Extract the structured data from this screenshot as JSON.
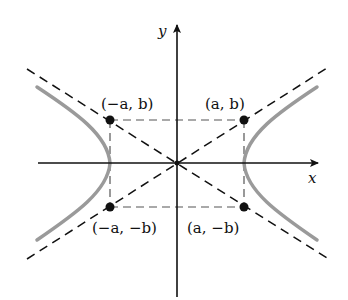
{
  "diagram": {
    "type": "hyperbola",
    "axes": {
      "x_label": "x",
      "y_label": "y"
    },
    "points": [
      {
        "id": "neg-a-b",
        "label": "(−a, b)"
      },
      {
        "id": "a-b",
        "label": "(a, b)"
      },
      {
        "id": "neg-a-neg-b",
        "label": "(−a, −b)"
      },
      {
        "id": "a-neg-b",
        "label": "(a, −b)"
      }
    ],
    "colors": {
      "axis": "#111111",
      "curve": "#9a9a9a",
      "asymptote": "#111111",
      "box": "#555555"
    }
  }
}
